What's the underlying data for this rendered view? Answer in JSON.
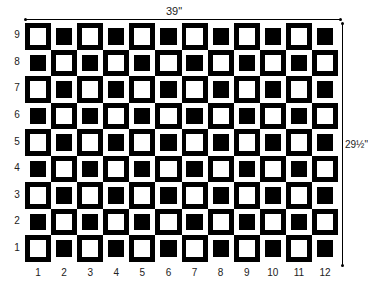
{
  "dimensions": {
    "width_label": "39\"",
    "height_label": "29½\""
  },
  "grid": {
    "columns": 12,
    "rows": 9,
    "column_labels": [
      "1",
      "2",
      "3",
      "4",
      "5",
      "6",
      "7",
      "8",
      "9",
      "10",
      "11",
      "12"
    ],
    "row_labels_top_to_bottom": [
      "9",
      "8",
      "7",
      "6",
      "5",
      "4",
      "3",
      "2",
      "1"
    ],
    "pattern": "checkerboard of squares with contrasting inner squares; black cell has white inner square, white cell has black inner square; row 9 col 1 black",
    "colors": {
      "dark": "#000000",
      "light": "#ffffff"
    }
  }
}
